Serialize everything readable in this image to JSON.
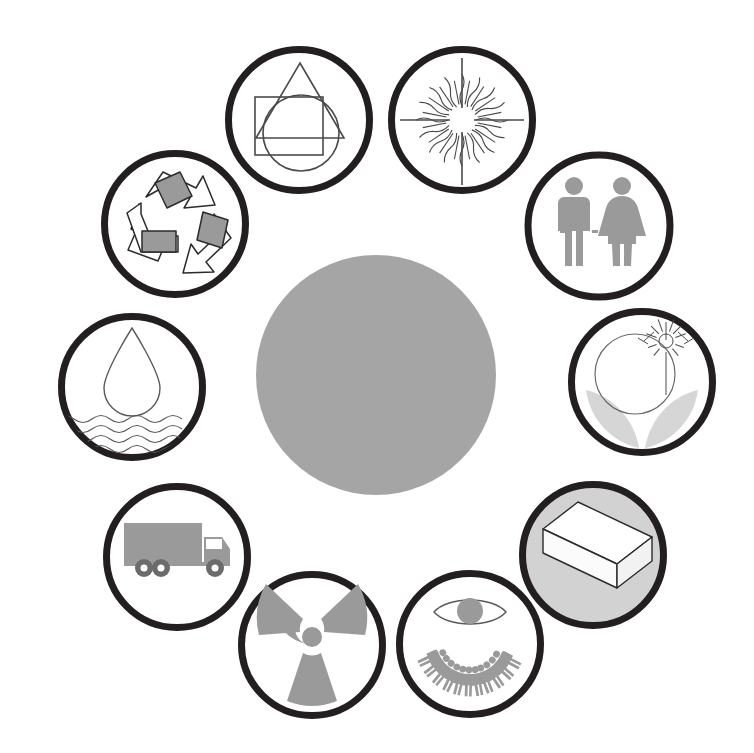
{
  "diagram": {
    "type": "radial-icon-ring",
    "background_color": "#ffffff",
    "node_count": 11,
    "center": {
      "name": "center-hub",
      "label": "",
      "fill_color": "#a5a5a5",
      "stroke_color": "none",
      "cx": 376,
      "cy": 375,
      "r": 120
    },
    "ring": {
      "radius": 255,
      "node_radius": 74,
      "stroke_color": "#231f20",
      "stroke_width": 7,
      "default_fill": "#ffffff",
      "icon_gray": "#9a9a9a",
      "icon_light_gray": "#d2d2d2",
      "icon_outline": "#3a3a3a"
    },
    "nodes": [
      {
        "id": "shapes",
        "label": "Shapes",
        "icon": "overlapping-shapes-icon",
        "description": "Triangle, square and circle overlapping outlines",
        "cx": 299,
        "cy": 120,
        "angle_deg": 253,
        "fill": "#ffffff",
        "style": "outline"
      },
      {
        "id": "sun",
        "label": "Sun",
        "icon": "sun-rays-icon",
        "description": "Radiant sun with wavy and straight rays",
        "cx": 462,
        "cy": 120,
        "angle_deg": 287,
        "fill": "#ffffff",
        "style": "outline"
      },
      {
        "id": "people-pair",
        "label": "People",
        "icon": "man-woman-icon",
        "description": "Male and female silhouette pair",
        "cx": 599,
        "cy": 226,
        "angle_deg": 323,
        "fill": "#ffffff",
        "style": "filled-gray"
      },
      {
        "id": "growth",
        "label": "Growth",
        "icon": "plant-sun-sprout-icon",
        "description": "Circle with small sun and two leaves sprouting",
        "cx": 642,
        "cy": 382,
        "angle_deg": 1,
        "fill": "#ffffff",
        "style": "mixed"
      },
      {
        "id": "materials",
        "label": "Materials",
        "icon": "3d-box-brick-icon",
        "description": "Isometric white rectangular block on a gray disc",
        "cx": 593,
        "cy": 555,
        "angle_deg": 40,
        "fill": "#d2d2d2",
        "style": "gray-disc"
      },
      {
        "id": "society",
        "label": "Society",
        "icon": "eye-over-people-circle-icon",
        "description": "Eye above a ring of human figures",
        "cx": 470,
        "cy": 644,
        "angle_deg": 70,
        "fill": "#ffffff",
        "style": "filled-gray"
      },
      {
        "id": "radiation",
        "label": "Radiation",
        "icon": "radiation-trefoil-icon",
        "description": "Radioactive trefoil symbol",
        "cx": 312,
        "cy": 645,
        "angle_deg": 105,
        "fill": "#ffffff",
        "style": "filled-gray"
      },
      {
        "id": "transport",
        "label": "Transport",
        "icon": "delivery-truck-icon",
        "description": "Box truck in side view",
        "cx": 177,
        "cy": 557,
        "angle_deg": 140,
        "fill": "#ffffff",
        "style": "filled-gray"
      },
      {
        "id": "water",
        "label": "Water",
        "icon": "water-drop-waves-icon",
        "description": "Water droplet above wavy water lines",
        "cx": 132,
        "cy": 387,
        "angle_deg": 180,
        "fill": "#ffffff",
        "style": "outline"
      },
      {
        "id": "recycling",
        "label": "Recycling",
        "icon": "recycling-arrows-icon",
        "description": "Three chasing arrows with gray panels",
        "cx": 175,
        "cy": 224,
        "angle_deg": 216,
        "fill": "#ffffff",
        "style": "mixed"
      },
      {
        "id": "energy-star",
        "label": "Energy",
        "icon": "starburst-icon",
        "description": "Fine starburst rays",
        "cx": 462,
        "cy": 120,
        "angle_deg": 287,
        "fill": "#ffffff",
        "style": "outline",
        "hidden": true
      }
    ]
  }
}
